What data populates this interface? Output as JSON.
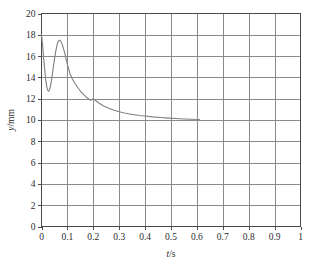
{
  "chart_data": {
    "type": "line",
    "title": "",
    "subtitle": "",
    "xlabel": "t/s",
    "ylabel": "y/mm",
    "xlim": [
      0,
      1
    ],
    "ylim": [
      0,
      20
    ],
    "xticks": [
      0,
      0.1,
      0.2,
      0.3,
      0.4,
      0.5,
      0.6,
      0.7,
      0.8,
      0.9,
      1
    ],
    "yticks": [
      0,
      2,
      4,
      6,
      8,
      10,
      12,
      14,
      16,
      18,
      20
    ],
    "xtick_labels": [
      "0",
      "0.1",
      "0.2",
      "0.3",
      "0.4",
      "0.5",
      "0.6",
      "0.7",
      "0.8",
      "0.9",
      "1"
    ],
    "ytick_labels": [
      "0",
      "2",
      "4",
      "6",
      "8",
      "10",
      "12",
      "14",
      "16",
      "18",
      "20"
    ],
    "grid": true,
    "legend": "none",
    "annotations": [],
    "series": [
      {
        "name": "y(t)",
        "color": "#808080",
        "x": [
          0.0,
          0.004,
          0.008,
          0.012,
          0.016,
          0.02,
          0.024,
          0.028,
          0.032,
          0.036,
          0.04,
          0.045,
          0.05,
          0.055,
          0.06,
          0.065,
          0.07,
          0.075,
          0.08,
          0.085,
          0.09,
          0.095,
          0.1,
          0.11,
          0.12,
          0.13,
          0.14,
          0.15,
          0.16,
          0.17,
          0.18,
          0.19,
          0.2,
          0.22,
          0.24,
          0.26,
          0.28,
          0.3,
          0.32,
          0.34,
          0.36,
          0.38,
          0.4,
          0.43,
          0.46,
          0.49,
          0.52,
          0.55,
          0.58,
          0.61
        ],
        "y": [
          18.0,
          17.1,
          15.9,
          14.8,
          13.85,
          13.15,
          12.78,
          12.7,
          12.9,
          13.35,
          13.95,
          14.85,
          15.7,
          16.45,
          17.05,
          17.42,
          17.5,
          17.38,
          17.1,
          16.7,
          16.25,
          15.75,
          15.2,
          14.35,
          13.8,
          13.4,
          13.05,
          12.72,
          12.45,
          12.22,
          12.02,
          11.85,
          12.0,
          11.62,
          11.32,
          11.1,
          10.92,
          10.78,
          10.66,
          10.57,
          10.49,
          10.42,
          10.37,
          10.29,
          10.23,
          10.18,
          10.14,
          10.1,
          10.07,
          10.05
        ]
      }
    ]
  },
  "axes": {
    "x_title": "t/s",
    "x_var": "t",
    "x_unit": "/s",
    "y_title": "y/mm",
    "y_var": "y",
    "y_unit": "/mm"
  },
  "colors": {
    "curve": "#808080",
    "grid": "#8a8a8a",
    "frame": "#4a4a4a",
    "text": "#2b2b2b",
    "background": "#ffffff"
  }
}
